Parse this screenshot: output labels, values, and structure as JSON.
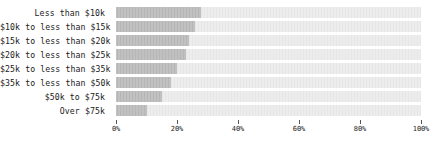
{
  "chart_data": {
    "type": "bar",
    "orientation": "horizontal",
    "stacked": true,
    "title": "",
    "subtitle": "",
    "xlabel": "",
    "ylabel": "",
    "xlim": [
      0,
      100
    ],
    "grid": false,
    "legend": null,
    "x_tick_labels": [
      "0%",
      "20%",
      "40%",
      "60%",
      "80%",
      "100%"
    ],
    "x_tick_values": [
      0,
      20,
      40,
      60,
      80,
      100
    ],
    "categories": [
      "Less than $10k",
      "$10k to less than $15k",
      "$15k to less than $20k",
      "$20k to less than $25k",
      "$25k to less than $35k",
      "$35k to less than $50k",
      "$50k to $75k",
      "Over $75k"
    ],
    "series": [
      {
        "name": "filled",
        "color": "#b6b6b6",
        "values": [
          28,
          26,
          24,
          23,
          20,
          18,
          15,
          10
        ]
      },
      {
        "name": "remainder",
        "color": "#e6e6e6",
        "values": [
          72,
          74,
          76,
          77,
          80,
          82,
          85,
          90
        ]
      }
    ]
  },
  "colors": {
    "fill": "#b6b6b6",
    "track": "#e6e6e6",
    "text": "#1a1a1a",
    "tick": "#555555",
    "background": "#ffffff"
  }
}
